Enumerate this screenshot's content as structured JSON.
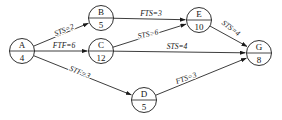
{
  "diagram": {
    "type": "precedence-network-diagram",
    "nodes": [
      {
        "id": "A",
        "label": "A",
        "duration": "4",
        "cx": 22,
        "cy": 51
      },
      {
        "id": "B",
        "label": "B",
        "duration": "5",
        "cx": 101,
        "cy": 18
      },
      {
        "id": "C",
        "label": "C",
        "duration": "12",
        "cx": 101,
        "cy": 51
      },
      {
        "id": "D",
        "label": "D",
        "duration": "5",
        "cx": 144,
        "cy": 100
      },
      {
        "id": "E",
        "label": "E",
        "duration": "10",
        "cx": 199,
        "cy": 20
      },
      {
        "id": "G",
        "label": "G",
        "duration": "8",
        "cx": 259,
        "cy": 53
      }
    ],
    "edges": [
      {
        "id": "A-B",
        "from": "A",
        "to": "B",
        "label": "STS=2",
        "lx": 64,
        "ly": 30,
        "rot": -23
      },
      {
        "id": "A-C",
        "from": "A",
        "to": "C",
        "label": "FTF=6",
        "lx": 64,
        "ly": 45,
        "rot": 0
      },
      {
        "id": "A-D",
        "from": "A",
        "to": "D",
        "label": "STF=3",
        "lx": 80,
        "ly": 72,
        "rot": 22
      },
      {
        "id": "B-E",
        "from": "B",
        "to": "E",
        "label": "FTS=3",
        "lx": 151,
        "ly": 13,
        "rot": 0
      },
      {
        "id": "C-E",
        "from": "C",
        "to": "E",
        "label": "STS=6",
        "lx": 148,
        "ly": 34,
        "rot": -12
      },
      {
        "id": "C-G",
        "from": "C",
        "to": "G",
        "label": "STS=4",
        "lx": 177,
        "ly": 46,
        "rot": 0
      },
      {
        "id": "D-G",
        "from": "D",
        "to": "G",
        "label": "FTS=3",
        "lx": 186,
        "ly": 78,
        "rot": -20
      },
      {
        "id": "E-G",
        "from": "E",
        "to": "G",
        "label": "STS=4",
        "lx": 231,
        "ly": 28,
        "rot": 37
      }
    ],
    "colors": {
      "stroke": "#1a1a1a",
      "text": "#141414",
      "background": "#ffffff"
    }
  }
}
